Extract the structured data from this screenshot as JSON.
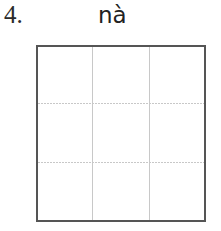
{
  "exercise": {
    "number": "4.",
    "pinyin": "nà",
    "grid": {
      "rows": 3,
      "cols": 3
    }
  }
}
